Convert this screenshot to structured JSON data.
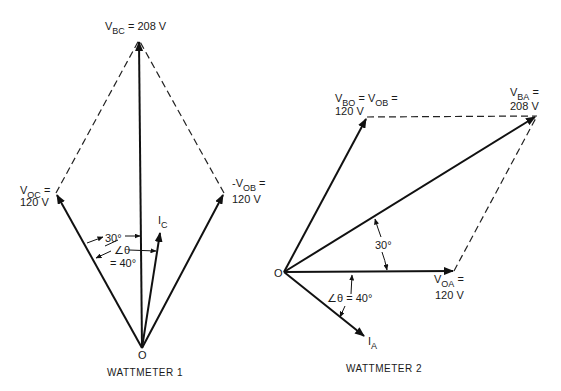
{
  "diagram_1": {
    "caption": "WATTMETER 1",
    "origin_label": "O",
    "v_bc": {
      "main": "V",
      "sub": "BC",
      "rest": " = 208 V"
    },
    "v_oc": {
      "main": "V",
      "sub": "OC",
      "rest": " =",
      "value": "120 V"
    },
    "neg_v_ob": {
      "main": "-V",
      "sub": "OB",
      "rest": " =",
      "value": "120 V"
    },
    "i_c": {
      "main": "I",
      "sub": "C"
    },
    "angle_30": "30°",
    "angle_theta": "∠θ",
    "angle_theta_value": "= 40°"
  },
  "diagram_2": {
    "caption": "WATTMETER 2",
    "origin_label": "O",
    "v_bo": {
      "main1": "V",
      "sub1": "BO",
      "mid": " = V",
      "sub2": "OB",
      "rest": " =",
      "value": "120 V"
    },
    "v_ba": {
      "main": "V",
      "sub": "BA",
      "rest": " =",
      "value": "208 V"
    },
    "v_oa": {
      "main": "V",
      "sub": "OA",
      "rest": " =",
      "value": "120 V"
    },
    "i_a": {
      "main": "I",
      "sub": "A"
    },
    "angle_30": "30°",
    "angle_theta": "∠θ = 40°"
  }
}
